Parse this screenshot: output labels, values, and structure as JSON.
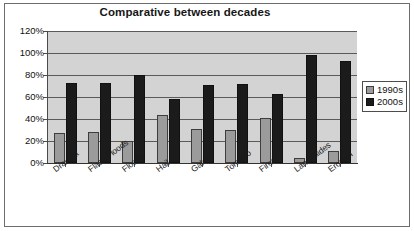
{
  "chart_data": {
    "type": "bar",
    "title": "Comparative between decades",
    "xlabel": "",
    "ylabel": "",
    "ylim": [
      0,
      120
    ],
    "ytick_labels": [
      "120%",
      "100%",
      "80%",
      "60%",
      "40%",
      "20%",
      "0%"
    ],
    "ytick_values": [
      120,
      100,
      80,
      60,
      40,
      20,
      0
    ],
    "grid": true,
    "legend_position": "right",
    "categories": [
      "Draught",
      "Flash Floods",
      "Floods",
      "Hail",
      "Gales",
      "Tornado",
      "Fires",
      "Land Slides",
      "Erosion"
    ],
    "series": [
      {
        "name": "1990s",
        "color": "#9b9b9b",
        "values": [
          27,
          28,
          20,
          44,
          31,
          30,
          41,
          5,
          11
        ]
      },
      {
        "name": "2000s",
        "color": "#1b1b1b",
        "values": [
          73,
          73,
          80,
          58,
          71,
          72,
          63,
          98,
          93
        ]
      }
    ]
  },
  "legend": {
    "entries": [
      {
        "label": "1990s"
      },
      {
        "label": "2000s"
      }
    ]
  },
  "colors": {
    "plot_background": "#d3d3d3",
    "series_1990s": "#9b9b9b",
    "series_2000s": "#1b1b1b",
    "gridline": "#5a5a5a",
    "frame": "#6d6d6d"
  }
}
